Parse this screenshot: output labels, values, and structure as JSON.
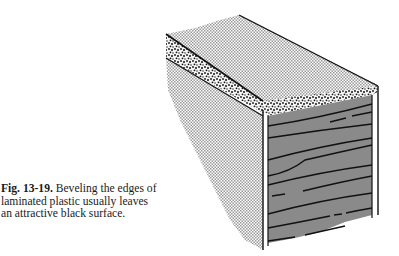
{
  "figure": {
    "label": "Fig. 13-19.",
    "caption_line1": " Beveling the edges of",
    "caption_line2": "laminated plastic usually leaves",
    "caption_line3": "an attractive black surface.",
    "illustration": "beveled-laminate-block",
    "colors": {
      "top_surface": "#c8c8c8",
      "side_shadow": "#d0d0d0",
      "front_face": "#8a8a8a",
      "outline": "#111111",
      "speckle": "#222222"
    }
  }
}
